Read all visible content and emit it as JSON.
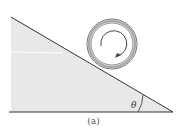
{
  "diagram": {
    "caption": "(a)",
    "angle_label": "θ",
    "incline": {
      "fill": "#e8e8e8",
      "stroke": "#333333"
    },
    "object": "rolling ring/cylinder with clockwise rotation arrow"
  }
}
